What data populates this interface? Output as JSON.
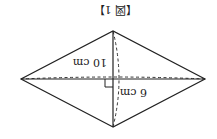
{
  "figure": {
    "caption": "【図 1】",
    "orientation": "rotated 180°",
    "shape": "rhombus",
    "diagonal_long_label": "10 cm",
    "diagonal_short_label": "6 cm",
    "colors": {
      "line": "#222222",
      "background": "#ffffff"
    }
  }
}
